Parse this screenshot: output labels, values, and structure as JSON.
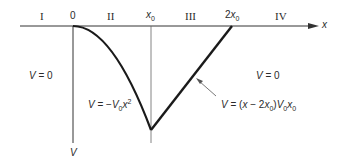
{
  "diagram": {
    "type": "potential-energy-graph",
    "axes": {
      "x_label": "x",
      "y_label": "V"
    },
    "regions": [
      {
        "id": "I",
        "label": "I"
      },
      {
        "id": "II",
        "label": "II"
      },
      {
        "id": "III",
        "label": "III"
      },
      {
        "id": "IV",
        "label": "IV"
      }
    ],
    "ticks": [
      {
        "label": "0"
      },
      {
        "label_base": "x",
        "label_sub": "0"
      },
      {
        "label_prefix": "2",
        "label_base": "x",
        "label_sub": "0"
      }
    ],
    "equations": {
      "region_I": {
        "lhs": "V",
        "rhs": " = 0"
      },
      "region_II": {
        "lhs": "V",
        "eq": " = −",
        "coef": "V",
        "coef_sub": "0",
        "var": "x",
        "exp": "2"
      },
      "region_III": {
        "lhs": "V",
        "eq": " = (",
        "var": "x",
        "minus": " − 2",
        "var2": "x",
        "sub0": "0",
        "close": ")",
        "coef": "V",
        "coef_sub": "0",
        "var3": "x",
        "sub1": "0"
      },
      "region_IV": {
        "lhs": "V",
        "rhs": " = 0"
      }
    },
    "colors": {
      "curve": "#1a1a1a",
      "axis": "#333333",
      "guide": "#666666",
      "text": "#2a2a2a"
    }
  }
}
